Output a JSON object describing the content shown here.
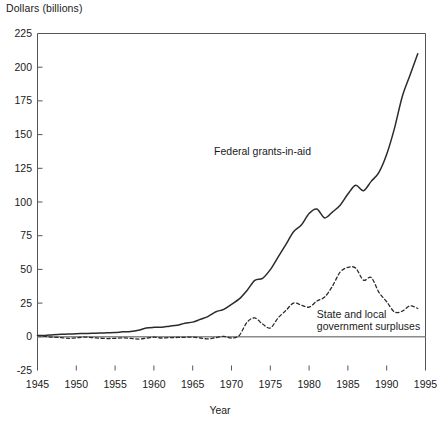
{
  "chart_data": {
    "type": "line",
    "title": "",
    "subtitle": "",
    "xlabel": "Year",
    "ylabel": "Dollars (billions)",
    "xlim": [
      1945,
      1995
    ],
    "ylim": [
      -25,
      225
    ],
    "xticks": [
      1945,
      1950,
      1955,
      1960,
      1965,
      1970,
      1975,
      1980,
      1985,
      1990,
      1995
    ],
    "yticks": [
      -25,
      0,
      25,
      50,
      75,
      100,
      125,
      150,
      175,
      200,
      225
    ],
    "grid": false,
    "legend_position": "inline-annotations",
    "zero_line": 0,
    "annotations": [
      {
        "text": "Federal grants-in-aid",
        "x": 1974,
        "y": 138
      },
      {
        "text": "State and local",
        "x": 1981,
        "y": 17
      },
      {
        "text": "government surpluses",
        "x": 1981,
        "y": 8
      }
    ],
    "series": [
      {
        "name": "Federal grants-in-aid",
        "style": "solid",
        "color": "#2b2b2b",
        "x": [
          1945,
          1946,
          1947,
          1948,
          1949,
          1950,
          1951,
          1952,
          1953,
          1954,
          1955,
          1956,
          1957,
          1958,
          1959,
          1960,
          1961,
          1962,
          1963,
          1964,
          1965,
          1966,
          1967,
          1968,
          1969,
          1970,
          1971,
          1972,
          1973,
          1974,
          1975,
          1976,
          1977,
          1978,
          1979,
          1980,
          1981,
          1982,
          1983,
          1984,
          1985,
          1986,
          1987,
          1988,
          1989,
          1990,
          1991,
          1992,
          1993,
          1994
        ],
        "values": [
          0.9,
          1.0,
          1.6,
          1.8,
          2.0,
          2.3,
          2.4,
          2.6,
          2.8,
          3.0,
          3.2,
          3.7,
          4.0,
          4.9,
          6.5,
          7.0,
          7.1,
          7.9,
          8.6,
          10.1,
          10.9,
          13.0,
          15.2,
          18.6,
          20.3,
          24.0,
          28.1,
          34.4,
          41.8,
          43.4,
          49.8,
          59.1,
          68.4,
          77.9,
          82.9,
          91.5,
          94.8,
          88.2,
          92.5,
          97.6,
          105.9,
          112.4,
          108.4,
          115.3,
          122.0,
          135.4,
          154.6,
          178.1,
          194.0,
          210.0
        ]
      },
      {
        "name": "State and local government surpluses",
        "style": "dashed",
        "color": "#2b2b2b",
        "x": [
          1945,
          1946,
          1947,
          1948,
          1949,
          1950,
          1951,
          1952,
          1953,
          1954,
          1955,
          1956,
          1957,
          1958,
          1959,
          1960,
          1961,
          1962,
          1963,
          1964,
          1965,
          1966,
          1967,
          1968,
          1969,
          1970,
          1971,
          1972,
          1973,
          1974,
          1975,
          1976,
          1977,
          1978,
          1979,
          1980,
          1981,
          1982,
          1983,
          1984,
          1985,
          1986,
          1987,
          1988,
          1989,
          1990,
          1991,
          1992,
          1993,
          1994
        ],
        "values": [
          1.1,
          0.3,
          -0.3,
          -0.6,
          -1.1,
          -0.8,
          -0.2,
          -0.6,
          -1.0,
          -1.3,
          -1.1,
          -0.8,
          -1.2,
          -1.7,
          -1.0,
          -0.3,
          -0.9,
          -0.6,
          -0.5,
          -0.4,
          -0.2,
          -0.9,
          -1.6,
          -0.6,
          0.3,
          -0.9,
          1.0,
          10.8,
          14.0,
          9.5,
          6.5,
          14.0,
          19.5,
          25.0,
          23.5,
          22.0,
          26.5,
          29.5,
          37.5,
          48.0,
          51.5,
          51.0,
          42.0,
          44.0,
          33.0,
          26.0,
          18.5,
          19.0,
          23.0,
          21.0
        ]
      }
    ]
  }
}
